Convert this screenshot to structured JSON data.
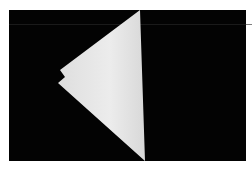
{
  "image": {
    "description": "White folded paper triangle on black background",
    "colors": {
      "background": "#030303",
      "border": "#ffffff",
      "paper": "#e9e9e9",
      "paper_shade": "#d6d6d6"
    }
  }
}
